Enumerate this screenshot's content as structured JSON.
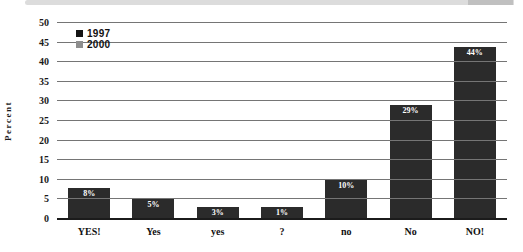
{
  "window": {
    "top_strip": {
      "track_color": "#dcdcdc",
      "thumb_color": "#c0c0c0"
    }
  },
  "chart_data": {
    "type": "bar",
    "title": "",
    "ylabel": "Percent",
    "xlabel": "",
    "categories": [
      "YES!",
      "Yes",
      "yes",
      "?",
      "no",
      "No",
      "NO!"
    ],
    "series": [
      {
        "name": "1997",
        "color": "#2b2b2b",
        "values": [
          8,
          5,
          3,
          1,
          10,
          29,
          44
        ]
      }
    ],
    "bar_labels": [
      "8%",
      "5%",
      "3%",
      "1%",
      "10%",
      "29%",
      "44%"
    ],
    "bar_label_color": "#ffffff",
    "ylim": [
      0,
      50
    ],
    "yticks": [
      0,
      5,
      10,
      15,
      20,
      25,
      30,
      35,
      40,
      45,
      50
    ],
    "grid": true,
    "gridline_color": "#757575",
    "baseline_color": "#1b1b1b",
    "legend_position": "top-left",
    "legend": [
      {
        "label": "1997",
        "color": "#141414"
      },
      {
        "label": "2000",
        "color": "#8e8e8e"
      }
    ]
  }
}
